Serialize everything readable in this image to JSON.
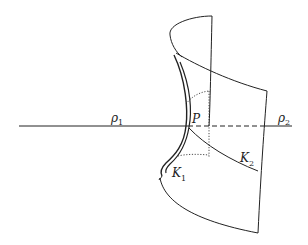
{
  "diagram": {
    "type": "saddle-surface-principal-curvatures",
    "colors": {
      "line": "#222222",
      "background": "#ffffff"
    },
    "labels": {
      "rho1": {
        "main": "ρ",
        "sub": "1"
      },
      "rho2": {
        "main": "ρ",
        "sub": "2"
      },
      "point": {
        "main": "P"
      },
      "k1": {
        "main": "K",
        "sub": "1"
      },
      "k2": {
        "main": "K",
        "sub": "2"
      }
    },
    "elements": [
      "horizontal-axis-line",
      "saddle-surface-outline",
      "principal-curve-K1",
      "principal-curve-K2",
      "hidden-dotted-construction-lines"
    ]
  }
}
